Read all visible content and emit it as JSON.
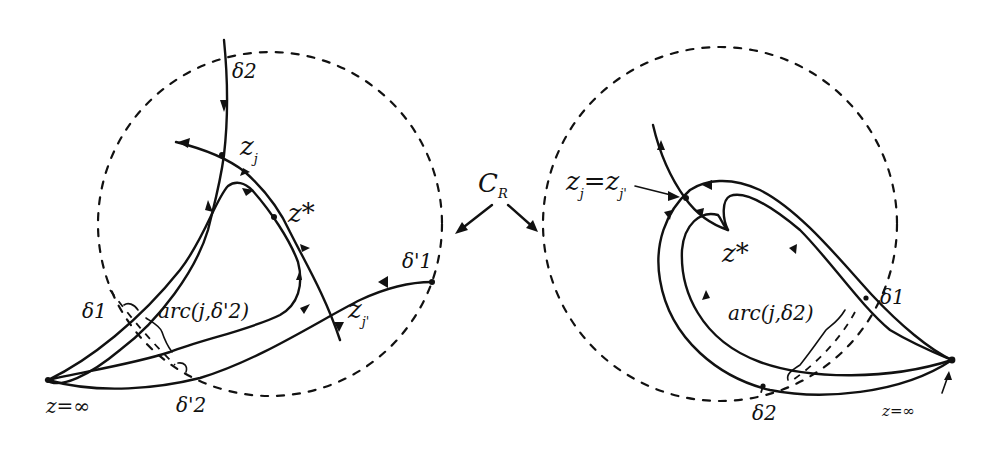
{
  "figure": {
    "shared_label": {
      "text": "C",
      "subscript": "R"
    },
    "left_panel": {
      "labels": {
        "delta2": "δ2",
        "zj": "z",
        "zj_sub": "j",
        "zstar": "z*",
        "zj_prime": "z",
        "zj_prime_sub": "j'",
        "delta1_prime": "δ'1",
        "delta1": "δ1",
        "arc": "arc(j,δ'2)",
        "delta2_prime": "δ'2",
        "z_inf": "z=∞"
      }
    },
    "right_panel": {
      "labels": {
        "zj_eq": "z",
        "zj_eq_sub1": "j",
        "zj_eq_mid": "=z",
        "zj_eq_sub2": "j'",
        "zstar": "z*",
        "delta1": "δ1",
        "arc": "arc(j,δ2)",
        "delta2": "δ2",
        "z_inf": "z=∞"
      }
    },
    "colors": {
      "ink": "#111111",
      "background": "#ffffff"
    }
  }
}
